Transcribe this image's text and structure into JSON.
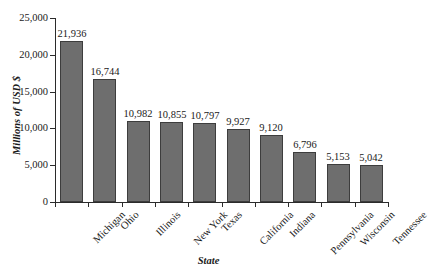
{
  "chart_data": {
    "type": "bar",
    "title": "",
    "xlabel": "State",
    "ylabel": "Millions of USD $",
    "categories": [
      "Michigan",
      "Ohio",
      "Illinois",
      "New York",
      "Texas",
      "California",
      "Indiana",
      "Pennsylvania",
      "Wisconsin",
      "Tennessee"
    ],
    "values": [
      21936,
      16744,
      10982,
      10855,
      10797,
      9927,
      9120,
      6796,
      5153,
      5042
    ],
    "value_labels": [
      "21,936",
      "16,744",
      "10,982",
      "10,855",
      "10,797",
      "9,927",
      "9,120",
      "6,796",
      "5,153",
      "5,042"
    ],
    "ylim": [
      0,
      25000
    ],
    "ytick_values": [
      0,
      5000,
      10000,
      15000,
      20000,
      25000
    ],
    "ytick_labels": [
      "0",
      "5,000",
      "10,000",
      "15,000",
      "20,000",
      "25,000"
    ],
    "grid": false,
    "legend": false,
    "bar_color": "#6e6e6e",
    "bar_edge_color": "#3d3d3d",
    "axis_color": "#2b2b2b",
    "background_color": "#ffffff"
  }
}
